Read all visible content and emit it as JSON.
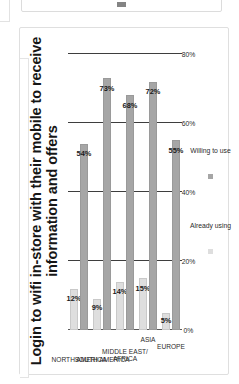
{
  "top_panel": {
    "mark_name": "partial-thumbnail-mark"
  },
  "chart_data": {
    "type": "bar",
    "orientation": "horizontal",
    "title": "Login to wifi in-store with their mobile to receive information and offers",
    "categories": [
      "NORTH AMERICA",
      "SOUTH AMERICA",
      "MIDDLE EAST/ AFRICA",
      "ASIA",
      "EUROPE"
    ],
    "series": [
      {
        "name": "Already using",
        "color": "#dedede",
        "values": [
          12,
          9,
          14,
          15,
          5
        ],
        "labels": [
          "12%",
          "9%",
          "14%",
          "15%",
          "5%"
        ]
      },
      {
        "name": "Willing to use",
        "color": "#a6a6a6",
        "values": [
          54,
          73,
          68,
          72,
          55
        ],
        "labels": [
          "54%",
          "73%",
          "68%",
          "72%",
          "55%"
        ]
      }
    ],
    "xlabel": "",
    "ylabel": "",
    "xlim": [
      0,
      80
    ],
    "ticks": [
      "0%",
      "20%",
      "40%",
      "60%",
      "80%"
    ],
    "tick_values": [
      0,
      20,
      40,
      60,
      80
    ],
    "grid": true,
    "legend_position": "bottom"
  }
}
